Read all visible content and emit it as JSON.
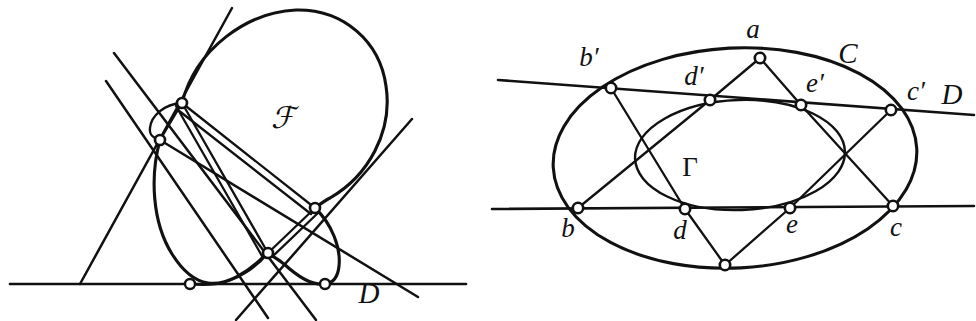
{
  "figure": {
    "background_color": "#ffffff",
    "ink_color": "#111111",
    "width": 976,
    "height": 321
  },
  "left_panel": {
    "name": "left-figure",
    "labels": [
      {
        "id": "curve-F",
        "text": "ℱ",
        "x": 283,
        "y": 128,
        "style": "script"
      },
      {
        "id": "line-D",
        "text": "D",
        "x": 369,
        "y": 303,
        "style": "italic-upper"
      }
    ],
    "nodes": [
      {
        "id": "node-upper",
        "x": 182,
        "y": 103,
        "r": 5.0,
        "kind": "double-point"
      },
      {
        "id": "node-upper-left",
        "x": 160,
        "y": 140,
        "r": 5.0,
        "kind": "double-point"
      },
      {
        "id": "node-right",
        "x": 315,
        "y": 208,
        "r": 5.0,
        "kind": "double-point"
      },
      {
        "id": "node-lower-mid",
        "x": 268,
        "y": 253,
        "r": 5.0,
        "kind": "double-point"
      },
      {
        "id": "node-on-line-left",
        "x": 190,
        "y": 284,
        "r": 5.0,
        "kind": "tangency-point"
      },
      {
        "id": "node-on-line-right",
        "x": 325,
        "y": 284,
        "r": 5.0,
        "kind": "tangency-point"
      }
    ],
    "baseline": {
      "id": "line-D",
      "x1": 10,
      "y1": 284,
      "x2": 466,
      "y2": 284
    },
    "tangent_count": 4
  },
  "right_panel": {
    "name": "right-figure",
    "labels": [
      {
        "id": "point-a",
        "text": "a",
        "x": 753,
        "y": 38,
        "style": "italic"
      },
      {
        "id": "conic-C",
        "text": "C",
        "x": 848,
        "y": 63,
        "style": "italic-upper"
      },
      {
        "id": "point-bp",
        "text": "b′",
        "x": 589,
        "y": 66,
        "style": "italic"
      },
      {
        "id": "point-dp",
        "text": "d′",
        "x": 694,
        "y": 85,
        "style": "italic"
      },
      {
        "id": "point-ep",
        "text": "e′",
        "x": 815,
        "y": 92,
        "style": "italic"
      },
      {
        "id": "point-cp",
        "text": "c′",
        "x": 916,
        "y": 100,
        "style": "italic"
      },
      {
        "id": "line-D",
        "text": "D",
        "x": 952,
        "y": 104,
        "style": "italic-upper"
      },
      {
        "id": "conic-G",
        "text": "Γ",
        "x": 690,
        "y": 176,
        "style": "greek"
      },
      {
        "id": "point-b",
        "text": "b",
        "x": 568,
        "y": 237,
        "style": "italic"
      },
      {
        "id": "point-d",
        "text": "d",
        "x": 680,
        "y": 239,
        "style": "italic"
      },
      {
        "id": "point-e",
        "text": "e",
        "x": 792,
        "y": 233,
        "style": "italic"
      },
      {
        "id": "point-c",
        "text": "c",
        "x": 896,
        "y": 236,
        "style": "italic"
      }
    ],
    "nodes": [
      {
        "id": "a",
        "x": 760,
        "y": 58,
        "r": 5.2
      },
      {
        "id": "b-prime",
        "x": 611,
        "y": 88,
        "r": 5.2
      },
      {
        "id": "d-prime",
        "x": 710,
        "y": 100,
        "r": 5.2
      },
      {
        "id": "e-prime",
        "x": 801,
        "y": 105,
        "r": 5.2
      },
      {
        "id": "c-prime",
        "x": 891,
        "y": 110,
        "r": 5.2
      },
      {
        "id": "b",
        "x": 578,
        "y": 208,
        "r": 5.2
      },
      {
        "id": "d",
        "x": 685,
        "y": 209,
        "r": 5.2
      },
      {
        "id": "e",
        "x": 790,
        "y": 208,
        "r": 5.2
      },
      {
        "id": "c",
        "x": 893,
        "y": 206,
        "r": 5.2
      },
      {
        "id": "bottom-apex",
        "x": 725,
        "y": 265,
        "r": 5.2
      }
    ],
    "chords": [
      {
        "id": "chord-a-dprime",
        "from": "a",
        "to": "d-prime"
      },
      {
        "id": "chord-a-eprime",
        "from": "a",
        "to": "e-prime"
      },
      {
        "id": "chord-bprime-d",
        "from": "b-prime",
        "to": "d"
      },
      {
        "id": "chord-b-dprime",
        "from": "b",
        "to": "d-prime"
      },
      {
        "id": "chord-eprime-c",
        "from": "e-prime",
        "to": "c"
      },
      {
        "id": "chord-e-cprime",
        "from": "e",
        "to": "c-prime"
      },
      {
        "id": "chord-d-apex",
        "from": "d",
        "to": "bottom-apex"
      },
      {
        "id": "chord-e-apex",
        "from": "e",
        "to": "bottom-apex"
      }
    ],
    "secant_lines": [
      {
        "id": "secant-upper",
        "x1": 498,
        "y1": 80,
        "x2": 978,
        "y2": 115,
        "through": [
          "b-prime",
          "d-prime",
          "e-prime",
          "c-prime"
        ]
      },
      {
        "id": "secant-lower",
        "x1": 492,
        "y1": 209,
        "x2": 978,
        "y2": 207,
        "through": [
          "b",
          "d",
          "e",
          "c"
        ]
      }
    ],
    "outer_conic": {
      "id": "C",
      "cx": 735,
      "cy": 158,
      "rx": 182,
      "ry": 110,
      "rotation": -3
    },
    "inner_conic": {
      "id": "G",
      "cx": 740,
      "cy": 155,
      "rx": 105,
      "ry": 55,
      "rotation": -2
    }
  }
}
